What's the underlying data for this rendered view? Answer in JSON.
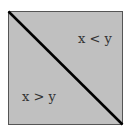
{
  "diagram": {
    "type": "region-partition",
    "shape": "square",
    "fill_color": "#c0c0c0",
    "border_color": "#555555",
    "diagonal_color": "#000000",
    "diagonal": "top-left to bottom-right",
    "regions": [
      {
        "position": "upper-right",
        "label": "x < y"
      },
      {
        "position": "lower-left",
        "label": "x > y"
      }
    ]
  }
}
